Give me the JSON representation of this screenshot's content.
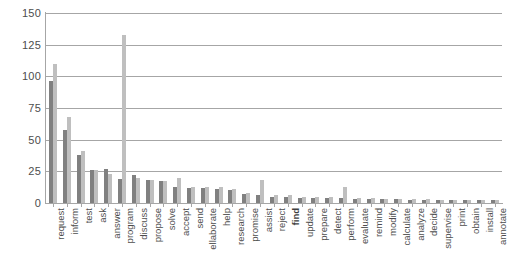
{
  "chart_data": {
    "type": "bar",
    "title": "",
    "subtitle": "",
    "xlabel": "",
    "ylabel": "",
    "ylim": [
      0,
      150
    ],
    "yticks": [
      0,
      25,
      50,
      75,
      100,
      125,
      150
    ],
    "grid": true,
    "legend": "none",
    "orientation": "vertical",
    "categories": [
      "request",
      "inform",
      "test",
      "ask",
      "answer",
      "program",
      "discuss",
      "propose",
      "solve",
      "accept",
      "send",
      "ellaborate",
      "help",
      "research",
      "promise",
      "assist",
      "reject",
      "find",
      "update",
      "prepare",
      "detect",
      "perform",
      "evaluate",
      "remind",
      "modify",
      "calculate",
      "analyze",
      "decide",
      "supervise",
      "print",
      "obtain",
      "install",
      "annotate"
    ],
    "bold_categories": [
      "find"
    ],
    "series": [
      {
        "name": "series-1",
        "color": "#808080",
        "values": [
          96,
          58,
          38,
          26,
          27,
          19,
          22,
          18,
          17,
          13,
          12,
          12,
          11,
          10,
          7,
          6,
          5,
          5,
          4,
          4,
          4,
          4,
          3,
          3,
          3,
          3,
          2,
          2,
          2,
          2,
          2,
          2,
          2
        ]
      },
      {
        "name": "series-2",
        "color": "#bfbfbf",
        "values": [
          110,
          68,
          41,
          26,
          23,
          133,
          20,
          18,
          17,
          20,
          13,
          13,
          13,
          11,
          8,
          18,
          6,
          6,
          5,
          5,
          5,
          13,
          4,
          4,
          3,
          3,
          3,
          3,
          2,
          2,
          2,
          2,
          2
        ]
      }
    ]
  }
}
